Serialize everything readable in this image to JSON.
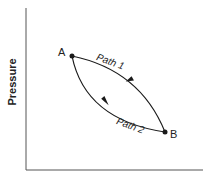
{
  "diagram": {
    "y_axis_label": "Pressure",
    "x_axis_label": "",
    "points": [
      {
        "label": "A",
        "x": 72,
        "y": 56
      },
      {
        "label": "B",
        "x": 165,
        "y": 132
      }
    ],
    "paths": [
      {
        "label": "Path 1",
        "from": "A",
        "to": "B",
        "side": "upper"
      },
      {
        "label": "Path 2",
        "from": "A",
        "to": "B",
        "side": "lower"
      }
    ],
    "colors": {
      "line": "#1a1a1a",
      "axis": "#555555"
    }
  }
}
